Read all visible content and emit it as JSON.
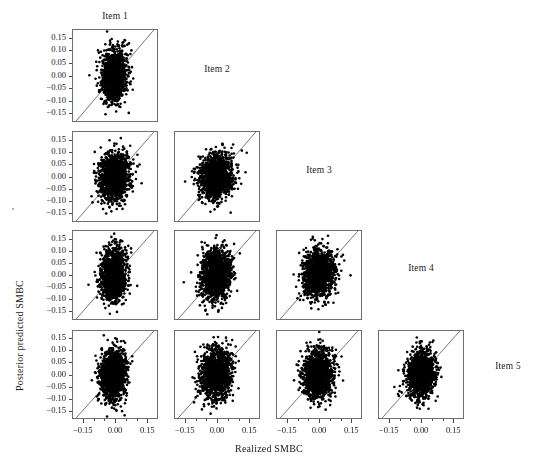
{
  "figure": {
    "title": "",
    "xaxis_title": "Realized SMBC",
    "yaxis_title": "Posterior predicted SMBC"
  },
  "chart_data": {
    "type": "scatter",
    "title": "",
    "subtitle": "",
    "xlabel": "Realized SMBC",
    "ylabel": "Posterior predicted SMBC",
    "xlim": [
      -0.2,
      0.2
    ],
    "ylim": [
      -0.185,
      0.185
    ],
    "xticks": [
      -0.15,
      0.0,
      0.15
    ],
    "xtick_labels": [
      "−0.15",
      "0.00",
      "0.15"
    ],
    "yticks": [
      0.15,
      0.1,
      0.05,
      0.0,
      -0.05,
      -0.1,
      -0.15
    ],
    "ytick_labels": [
      "0.15",
      "0.10",
      "0.05",
      "0.00",
      "−0.05",
      "−0.10",
      "−0.15"
    ],
    "minor_xticks": [
      -0.1,
      -0.05,
      0.05,
      0.1
    ],
    "grid": false,
    "legend": null,
    "reference_line": {
      "type": "identity",
      "equation": "y = x",
      "color": "#555555",
      "width": 0.8
    },
    "point_color": "#000000",
    "point_size": 2.6,
    "matrix_layout": "lower-triangular",
    "rows": 4,
    "cols": 4,
    "items": [
      "Item 1",
      "Item 2",
      "Item 3",
      "Item 4",
      "Item 5"
    ],
    "panels": [
      {
        "row": 0,
        "col": 0,
        "x_item": "Item 1",
        "y_item": "Item 2",
        "n_points": 1400,
        "mean_x": -0.006,
        "mean_y": -0.002,
        "sd_x": 0.028,
        "sd_y": 0.05,
        "corr": 0.1,
        "seed": 11
      },
      {
        "row": 1,
        "col": 0,
        "x_item": "Item 1",
        "y_item": "Item 3",
        "n_points": 1400,
        "mean_x": -0.004,
        "mean_y": -0.004,
        "sd_x": 0.035,
        "sd_y": 0.048,
        "corr": 0.08,
        "seed": 21
      },
      {
        "row": 1,
        "col": 1,
        "x_item": "Item 2",
        "y_item": "Item 3",
        "n_points": 1400,
        "mean_x": -0.004,
        "mean_y": 0.0,
        "sd_x": 0.04,
        "sd_y": 0.046,
        "corr": 0.05,
        "seed": 22
      },
      {
        "row": 2,
        "col": 0,
        "x_item": "Item 1",
        "y_item": "Item 4",
        "n_points": 1400,
        "mean_x": -0.008,
        "mean_y": 0.002,
        "sd_x": 0.029,
        "sd_y": 0.052,
        "corr": 0.09,
        "seed": 31
      },
      {
        "row": 2,
        "col": 1,
        "x_item": "Item 2",
        "y_item": "Item 4",
        "n_points": 1400,
        "mean_x": -0.005,
        "mean_y": 0.002,
        "sd_x": 0.035,
        "sd_y": 0.05,
        "corr": 0.07,
        "seed": 32
      },
      {
        "row": 2,
        "col": 2,
        "x_item": "Item 3",
        "y_item": "Item 4",
        "n_points": 1400,
        "mean_x": -0.003,
        "mean_y": 0.004,
        "sd_x": 0.036,
        "sd_y": 0.05,
        "corr": 0.1,
        "seed": 33
      },
      {
        "row": 3,
        "col": 0,
        "x_item": "Item 1",
        "y_item": "Item 5",
        "n_points": 1400,
        "mean_x": -0.008,
        "mean_y": 0.0,
        "sd_x": 0.031,
        "sd_y": 0.054,
        "corr": 0.08,
        "seed": 41
      },
      {
        "row": 3,
        "col": 1,
        "x_item": "Item 2",
        "y_item": "Item 5",
        "n_points": 1400,
        "mean_x": -0.004,
        "mean_y": 0.003,
        "sd_x": 0.037,
        "sd_y": 0.052,
        "corr": 0.09,
        "seed": 42
      },
      {
        "row": 3,
        "col": 2,
        "x_item": "Item 3",
        "y_item": "Item 5",
        "n_points": 1400,
        "mean_x": -0.006,
        "mean_y": 0.001,
        "sd_x": 0.035,
        "sd_y": 0.052,
        "corr": 0.07,
        "seed": 43
      },
      {
        "row": 3,
        "col": 3,
        "x_item": "Item 4",
        "y_item": "Item 5",
        "n_points": 1400,
        "mean_x": 0.002,
        "mean_y": 0.002,
        "sd_x": 0.032,
        "sd_y": 0.047,
        "corr": 0.12,
        "seed": 44
      }
    ],
    "diagonal_labels": [
      {
        "text": "Item 1",
        "row": -1,
        "col": 0
      },
      {
        "text": "Item 2",
        "row": 0,
        "col": 1
      },
      {
        "text": "Item 3",
        "row": 1,
        "col": 2
      },
      {
        "text": "Item 4",
        "row": 2,
        "col": 3
      },
      {
        "text": "Item 5",
        "row": 3,
        "col": 4
      }
    ]
  },
  "geometry": {
    "col_x": [
      72,
      174,
      276,
      378
    ],
    "row_y": [
      29,
      131,
      230,
      330
    ],
    "panel_w": 86,
    "panel_h": 92,
    "row_h": [
      93,
      91,
      90,
      89
    ]
  }
}
